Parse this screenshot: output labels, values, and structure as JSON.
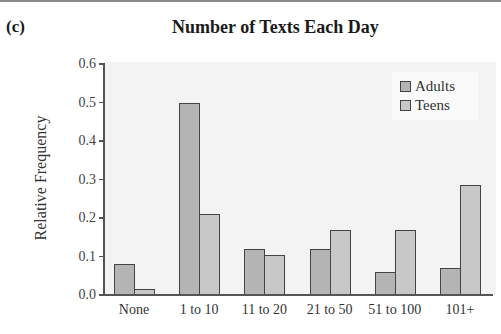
{
  "panel_label": "(c)",
  "chart_data": {
    "type": "bar",
    "title": "Number of Texts Each Day",
    "xlabel": "",
    "ylabel": "Relative Frequency",
    "ylim": [
      0,
      0.6
    ],
    "yticks": [
      "0.0",
      "0.1",
      "0.2",
      "0.3",
      "0.4",
      "0.5",
      "0.6"
    ],
    "grid": false,
    "legend_position": "upper right",
    "categories": [
      "None",
      "1 to 10",
      "11 to 20",
      "21 to 50",
      "51 to 100",
      "101+"
    ],
    "series": [
      {
        "name": "Adults",
        "color": "#b4b4b4",
        "values": [
          0.08,
          0.5,
          0.12,
          0.12,
          0.06,
          0.07
        ]
      },
      {
        "name": "Teens",
        "color": "#c8c8c8",
        "values": [
          0.015,
          0.21,
          0.105,
          0.17,
          0.17,
          0.285
        ]
      }
    ]
  }
}
